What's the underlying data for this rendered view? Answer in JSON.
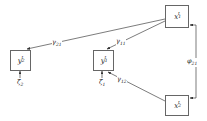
{
  "diagram": {
    "nodes": [
      {
        "id": "x1",
        "base": "x",
        "sub": "1",
        "sup": "t"
      },
      {
        "id": "x2",
        "base": "x",
        "sub": "2",
        "sup": "t"
      },
      {
        "id": "y1",
        "base": "y",
        "sub": "1",
        "sup": "t"
      },
      {
        "id": "y2",
        "base": "y",
        "sub": "2",
        "sup": "t"
      }
    ],
    "disturbances": [
      {
        "id": "zeta1",
        "base": "ζ",
        "sub": "1",
        "sup": "t",
        "target": "y1"
      },
      {
        "id": "zeta2",
        "base": "ζ",
        "sub": "2",
        "sup": "t",
        "target": "y2"
      }
    ],
    "edges": [
      {
        "id": "gamma21",
        "base": "γ",
        "sub": "21",
        "sup": "t",
        "from": "x1",
        "to": "y2"
      },
      {
        "id": "gamma11",
        "base": "γ",
        "sub": "11",
        "sup": "t",
        "from": "x1",
        "to": "y1"
      },
      {
        "id": "gamma12",
        "base": "γ",
        "sub": "12",
        "sup": "t",
        "from": "x2",
        "to": "y1"
      },
      {
        "id": "phi21",
        "base": "φ",
        "sub": "21",
        "sup": "t",
        "from": "x2",
        "to": "x1",
        "type": "covariance"
      }
    ]
  }
}
